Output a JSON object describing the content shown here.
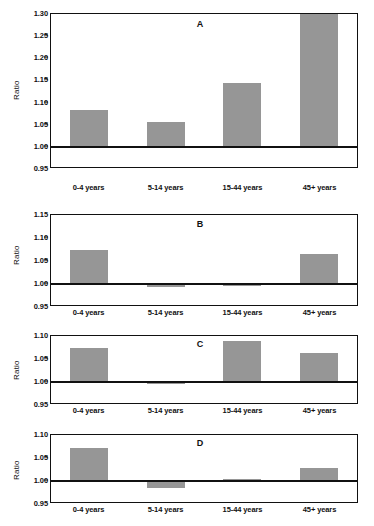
{
  "figure": {
    "ylabel": "Ratio",
    "categories": [
      "0-4 years",
      "5-14 years",
      "15-44 years",
      "45+ years"
    ],
    "bar_color": "#969696",
    "axis_color": "#111111",
    "baseline_value": 1.0
  },
  "panels": [
    {
      "title": "A",
      "ylabel": "Ratio",
      "ticks": [
        "1.30",
        "1.25",
        "1.20",
        "1.15",
        "1.10",
        "1.05",
        "1.00",
        "0.95"
      ],
      "tick_values": [
        1.3,
        1.25,
        1.2,
        1.15,
        1.1,
        1.05,
        1.0,
        0.95
      ],
      "values": [
        1.083,
        1.056,
        1.145,
        1.3
      ]
    },
    {
      "title": "B",
      "ylabel": "Ratio",
      "ticks": [
        "1.15",
        "1.10",
        "1.05",
        "1.00",
        "0.95"
      ],
      "tick_values": [
        1.15,
        1.1,
        1.05,
        1.0,
        0.95
      ],
      "values": [
        1.073,
        0.994,
        0.995,
        1.066
      ]
    },
    {
      "title": "C",
      "ylabel": "Ratio",
      "ticks": [
        "1.10",
        "1.05",
        "1.00",
        "0.95"
      ],
      "tick_values": [
        1.1,
        1.05,
        1.0,
        0.95
      ],
      "values": [
        1.074,
        0.996,
        1.09,
        1.063
      ]
    },
    {
      "title": "D",
      "ylabel": "Ratio",
      "ticks": [
        "1.10",
        "1.05",
        "1.00",
        "0.95"
      ],
      "tick_values": [
        1.1,
        1.05,
        1.0,
        0.95
      ],
      "values": [
        1.072,
        0.984,
        1.005,
        1.028
      ]
    }
  ],
  "chart_data": {
    "type": "bar",
    "title": "",
    "xlabel": "",
    "ylabel": "Ratio",
    "categories": [
      "0-4 years",
      "5-14 years",
      "15-44 years",
      "45+ years"
    ],
    "grid": false,
    "legend": "none",
    "baseline": 1.0,
    "panels": [
      {
        "label": "A",
        "ylim": [
          0.95,
          1.3
        ],
        "yticks": [
          0.95,
          1.0,
          1.05,
          1.1,
          1.15,
          1.2,
          1.25,
          1.3
        ],
        "values": [
          1.083,
          1.056,
          1.145,
          1.3
        ],
        "note": "45+ years bar is clipped at the axis maximum (1.30)"
      },
      {
        "label": "B",
        "ylim": [
          0.95,
          1.15
        ],
        "yticks": [
          0.95,
          1.0,
          1.05,
          1.1,
          1.15
        ],
        "values": [
          1.073,
          0.994,
          0.995,
          1.066
        ]
      },
      {
        "label": "C",
        "ylim": [
          0.95,
          1.1
        ],
        "yticks": [
          0.95,
          1.0,
          1.05,
          1.1
        ],
        "values": [
          1.074,
          0.996,
          1.09,
          1.063
        ]
      },
      {
        "label": "D",
        "ylim": [
          0.95,
          1.1
        ],
        "yticks": [
          0.95,
          1.0,
          1.05,
          1.1
        ],
        "values": [
          1.072,
          0.984,
          1.005,
          1.028
        ]
      }
    ]
  }
}
